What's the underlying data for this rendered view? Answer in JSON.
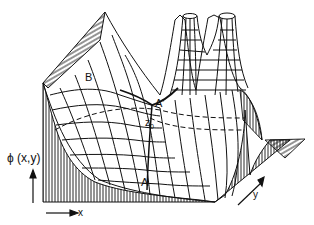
{
  "figure": {
    "type": "3d-surface-wireframe",
    "colors": {
      "line": "#111111",
      "background": "#ffffff"
    }
  },
  "labels": {
    "point_b": "B",
    "point_a_prime": "A'",
    "point_z0": "z",
    "point_z0_sub": "0",
    "point_a": "A",
    "axis_phi": "ϕ (x,y)",
    "axis_x": "x",
    "axis_y": "y"
  }
}
